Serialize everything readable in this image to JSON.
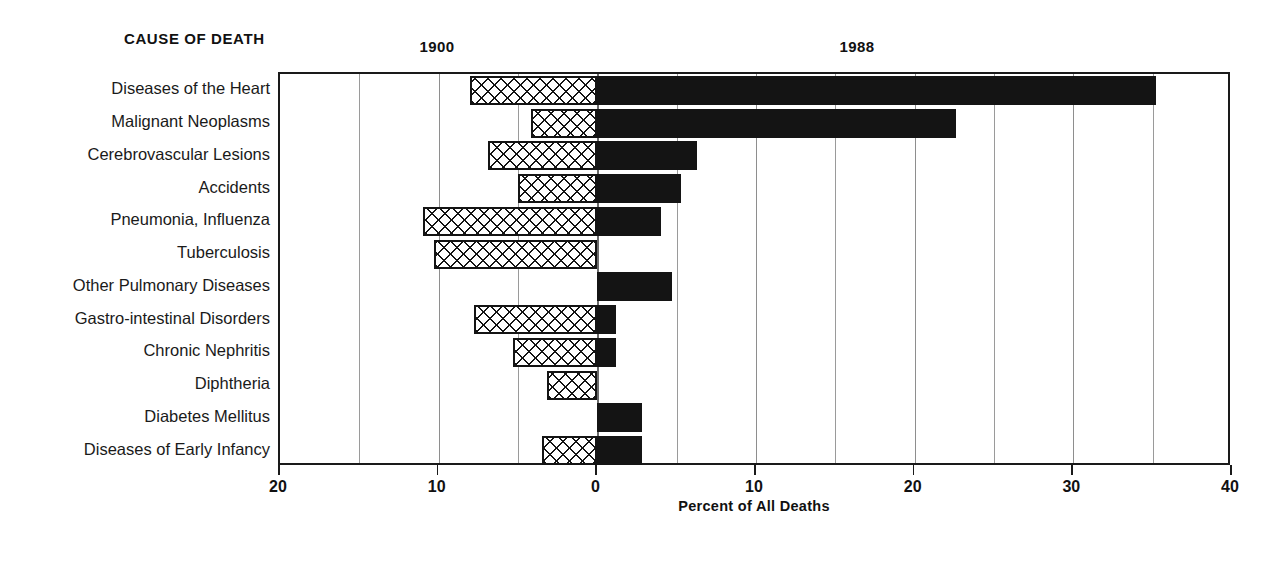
{
  "header": {
    "cause_of_death_label": "CAUSE OF DEATH",
    "series_labels": [
      {
        "name": "1900",
        "x_center": 437
      },
      {
        "name": "1988",
        "x_center": 857
      }
    ]
  },
  "axis": {
    "title": "Percent of All Deaths",
    "tick_labels": [
      "20",
      "10",
      "0",
      "10",
      "20",
      "30",
      "40"
    ],
    "tick_values": [
      -20,
      -10,
      0,
      10,
      20,
      30,
      40
    ],
    "gridline_values": [
      -15,
      -5,
      5,
      15,
      25,
      35
    ],
    "min": -20,
    "max": 40
  },
  "colors": {
    "bar_1988": "#141414",
    "bar_1900_outline": "#141414",
    "bar_1900_fill": "#ffffff",
    "gridline": "#9a9a9a",
    "frame": "#1a1a1a",
    "text": "#111111",
    "background": "#ffffff"
  },
  "chart_data": {
    "type": "bar",
    "orientation": "horizontal",
    "style": "back-to-back population pyramid",
    "title": "",
    "xlabel": "Percent of All Deaths",
    "ylabel": "CAUSE OF DEATH",
    "xlim": [
      -20,
      40
    ],
    "xticks": [
      -20,
      -10,
      0,
      10,
      20,
      30,
      40
    ],
    "xticklabels": [
      "20",
      "10",
      "0",
      "10",
      "20",
      "30",
      "40"
    ],
    "grid": true,
    "legend": "inline column headers (1900 left of zero, 1988 right of zero)",
    "categories": [
      "Diseases of the Heart",
      "Malignant Neoplasms",
      "Cerebrovascular Lesions",
      "Accidents",
      "Pneumonia, Influenza",
      "Tuberculosis",
      "Other Pulmonary Diseases",
      "Gastro-intestinal Disorders",
      "Chronic Nephritis",
      "Diphtheria",
      "Diabetes Mellitus",
      "Diseases of Early Infancy"
    ],
    "series": [
      {
        "name": "1900",
        "direction": "left",
        "pattern": "cross-hatch",
        "values": [
          8.0,
          4.2,
          6.9,
          5.0,
          11.0,
          10.3,
          0.0,
          7.8,
          5.3,
          3.2,
          0.0,
          3.5
        ]
      },
      {
        "name": "1988",
        "direction": "right",
        "pattern": "solid-black",
        "values": [
          35.2,
          22.6,
          6.3,
          5.3,
          4.0,
          0.0,
          4.7,
          1.2,
          1.2,
          0.0,
          2.8,
          2.8
        ]
      }
    ]
  }
}
